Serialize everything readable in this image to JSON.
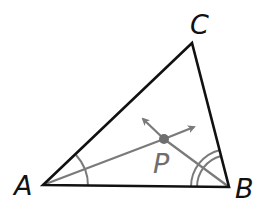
{
  "diagram": {
    "type": "triangle-angle-bisectors",
    "vertices": {
      "A": {
        "label": "A",
        "x": 43,
        "y": 185
      },
      "B": {
        "label": "B",
        "x": 229,
        "y": 187
      },
      "C": {
        "label": "C",
        "x": 192,
        "y": 43
      }
    },
    "incenter": {
      "label": "P",
      "x": 164,
      "y": 139
    },
    "labels": {
      "A": "A",
      "B": "B",
      "C": "C",
      "P": "P"
    },
    "angle_marks": {
      "A": {
        "arcs": 1,
        "radius": 45
      },
      "B": {
        "arcs": 2,
        "radii": [
          32,
          38
        ]
      }
    },
    "colors": {
      "triangle": "#111111",
      "bisector": "#7a7a7a",
      "point": "#6e6e6e",
      "arc": "#7a7a7a"
    }
  }
}
